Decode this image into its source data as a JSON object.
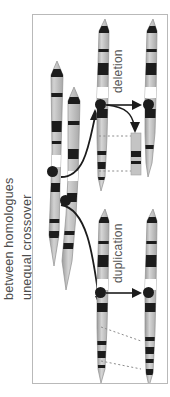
{
  "figure": {
    "title_left": "between homologues",
    "subtitle_left": "unequal crossover",
    "outcome_top": "deletion",
    "outcome_bottom": "duplication",
    "background_color": "#ffffff",
    "frame_color": "#b9b9b9",
    "chromosome_body_color": "#b3b3b3",
    "band_color": "#1c1c1c",
    "centromere_color": "#1c1c1c",
    "label_color": "#4d4d4d",
    "guide_color": "#8c8c8c"
  },
  "icons": {
    "centromere": "centromere-dot",
    "arrow": "arrow-right-icon",
    "curved_arrow": "curved-arrow-icon",
    "dashed_guide": "dashed-guide-line"
  },
  "panel": {
    "groups": [
      {
        "id": "parent-homologues",
        "name": "paired homologous chromosomes misaligned at crossover",
        "chromosomes": [
          {
            "id": "homologue-a",
            "bands": 6,
            "centromere": true
          },
          {
            "id": "homologue-b",
            "bands": 6,
            "centromere": true
          }
        ]
      },
      {
        "id": "deletion-products",
        "name": "deletion chromosome and excised fragment",
        "chromosomes": [
          {
            "id": "recombinant-deletion-pre",
            "bands": 5,
            "centromere": true
          },
          {
            "id": "recombinant-deletion-post",
            "bands": 4,
            "centromere": true
          }
        ],
        "fragment": {
          "id": "excised-fragment",
          "bands": 2
        }
      },
      {
        "id": "duplication-products",
        "name": "duplication chromosome before and after",
        "chromosomes": [
          {
            "id": "recombinant-duplication-pre",
            "bands": 6,
            "centromere": true
          },
          {
            "id": "recombinant-duplication-post",
            "bands": 7,
            "centromere": true
          }
        ]
      }
    ]
  }
}
